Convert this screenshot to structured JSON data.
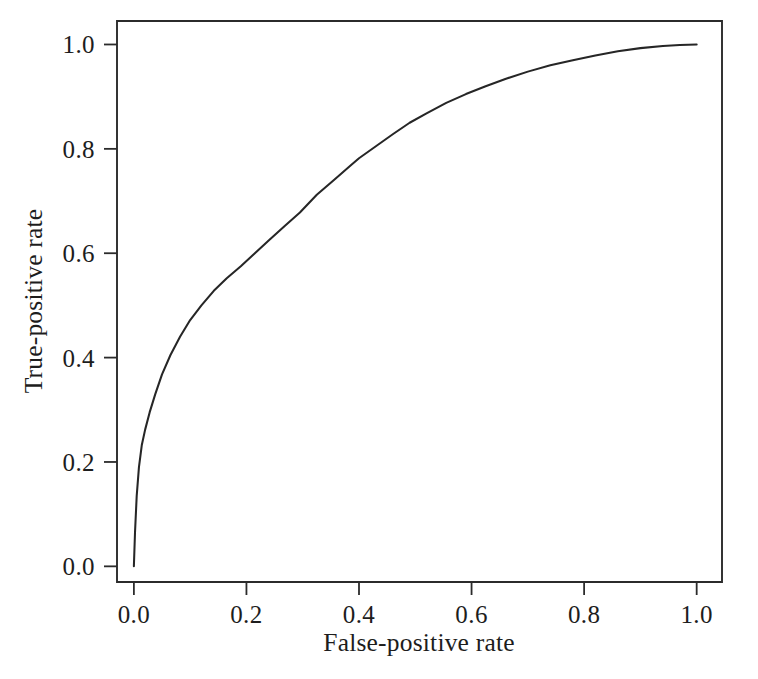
{
  "figure": {
    "kind": "roc-curve-figure",
    "background_color": "#ffffff",
    "line_color": "#262626",
    "text_color": "#1d1d1d"
  },
  "axes": {
    "x_title": "False-positive rate",
    "y_title": "True-positive rate",
    "x_tick_labels": [
      "0.0",
      "0.2",
      "0.4",
      "0.6",
      "0.8",
      "1.0"
    ],
    "y_tick_labels": [
      "0.0",
      "0.2",
      "0.4",
      "0.6",
      "0.8",
      "1.0"
    ]
  },
  "chart_data": {
    "type": "line",
    "title": "",
    "subtitle": "",
    "xlabel": "False-positive rate",
    "ylabel": "True-positive rate",
    "xlim": [
      -0.03,
      1.045
    ],
    "ylim": [
      -0.03,
      1.045
    ],
    "xticks": [
      0.0,
      0.2,
      0.4,
      0.6,
      0.8,
      1.0
    ],
    "yticks": [
      0.0,
      0.2,
      0.4,
      0.6,
      0.8,
      1.0
    ],
    "grid": false,
    "legend": false,
    "legend_position": "none",
    "frame": "box",
    "annotations": [],
    "series": [
      {
        "name": "ROC curve",
        "color": "#262626",
        "x": [
          0.0,
          0.002,
          0.005,
          0.009,
          0.014,
          0.02,
          0.028,
          0.038,
          0.05,
          0.065,
          0.082,
          0.1,
          0.12,
          0.142,
          0.165,
          0.19,
          0.215,
          0.24,
          0.268,
          0.295,
          0.325,
          0.355,
          0.385,
          0.4,
          0.43,
          0.46,
          0.49,
          0.52,
          0.555,
          0.59,
          0.625,
          0.66,
          0.7,
          0.74,
          0.78,
          0.82,
          0.86,
          0.9,
          0.94,
          0.97,
          1.0
        ],
        "y": [
          0.0,
          0.065,
          0.135,
          0.19,
          0.232,
          0.262,
          0.295,
          0.33,
          0.368,
          0.405,
          0.44,
          0.472,
          0.5,
          0.528,
          0.552,
          0.575,
          0.6,
          0.625,
          0.652,
          0.678,
          0.712,
          0.74,
          0.768,
          0.782,
          0.805,
          0.828,
          0.85,
          0.868,
          0.888,
          0.905,
          0.92,
          0.934,
          0.948,
          0.96,
          0.97,
          0.979,
          0.987,
          0.993,
          0.997,
          0.999,
          1.0
        ]
      }
    ]
  }
}
